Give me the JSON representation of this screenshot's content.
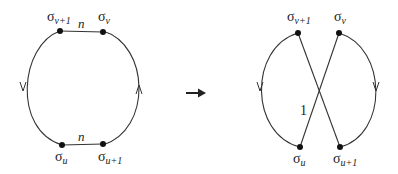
{
  "diagram": {
    "left": {
      "nodes": {
        "top_left": {
          "symbol": "σ",
          "sub": "v+1"
        },
        "top_right": {
          "symbol": "σ",
          "sub": "v"
        },
        "bottom_left": {
          "symbol": "σ",
          "sub": "u"
        },
        "bottom_right": {
          "symbol": "σ",
          "sub": "u+1"
        }
      },
      "edge_labels": {
        "top": "n",
        "bottom": "n"
      }
    },
    "transition_arrow": "→",
    "right": {
      "nodes": {
        "top_left": {
          "symbol": "σ",
          "sub": "v+1"
        },
        "top_right": {
          "symbol": "σ",
          "sub": "v"
        },
        "bottom_left": {
          "symbol": "σ",
          "sub": "u"
        },
        "bottom_right": {
          "symbol": "σ",
          "sub": "u+1"
        }
      },
      "edge_labels": {
        "cross": "1"
      }
    }
  },
  "colors": {
    "stroke": "#333333",
    "dot": "#111111",
    "background": "#ffffff"
  }
}
